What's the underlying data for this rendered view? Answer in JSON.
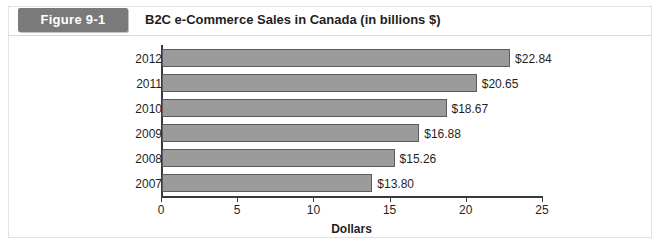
{
  "figure": {
    "badge_label": "Figure 9-1",
    "title": "B2C e-Commerce Sales in Canada (in billions $)",
    "badge_color": "#7a7a7a",
    "bar_color": "#9b9b9b",
    "bar_border_color": "#5c5c5c",
    "axis_color": "#3a3a3a"
  },
  "chart_data": {
    "type": "bar",
    "orientation": "horizontal",
    "title": "B2C e-Commerce Sales in Canada (in billions $)",
    "categories": [
      "2012",
      "2011",
      "2010",
      "2009",
      "2008",
      "2007"
    ],
    "values": [
      22.84,
      20.65,
      18.67,
      16.88,
      15.26,
      13.8
    ],
    "data_labels": [
      "$22.84",
      "$20.65",
      "$18.67",
      "$16.88",
      "$15.26",
      "$13.80"
    ],
    "xlabel": "Dollars",
    "ylabel": "",
    "xlim": [
      0,
      25
    ],
    "xticks": [
      0,
      5,
      10,
      15,
      20,
      25
    ],
    "xtick_labels": [
      "0",
      "5",
      "10",
      "15",
      "20",
      "25"
    ],
    "grid": false,
    "legend": null,
    "series": [
      {
        "name": "B2C e-Commerce Sales",
        "values": [
          22.84,
          20.65,
          18.67,
          16.88,
          15.26,
          13.8
        ]
      }
    ]
  }
}
